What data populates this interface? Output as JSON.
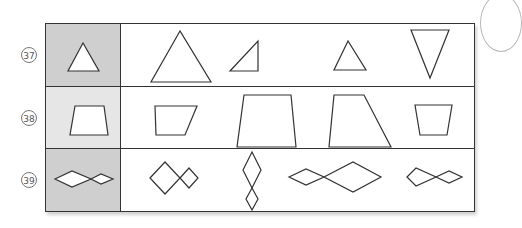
{
  "worksheet": {
    "rows": [
      {
        "number": "37",
        "label": "㊲",
        "reference_shape": "equilateral-triangle",
        "reference_bg": "#cfcfcf",
        "options": [
          "large-triangle",
          "right-triangle",
          "small-triangle",
          "inverted-triangle"
        ]
      },
      {
        "number": "38",
        "label": "㊳",
        "reference_shape": "trapezoid",
        "reference_bg": "#e6e6e6",
        "options": [
          "slanted-quadrilateral",
          "large-trapezoid",
          "right-trapezoid",
          "small-trapezoid"
        ]
      },
      {
        "number": "39",
        "label": "㊴",
        "reference_shape": "double-rhombus-horizontal",
        "reference_bg": "#cfcfcf",
        "options": [
          "double-square-diagonal",
          "double-rhombus-vertical",
          "double-rhombus-reversed",
          "double-rhombus-small"
        ]
      }
    ]
  },
  "colors": {
    "line": "#333333",
    "reference_dark": "#cfcfcf",
    "reference_light": "#e6e6e6",
    "background": "#ffffff"
  }
}
